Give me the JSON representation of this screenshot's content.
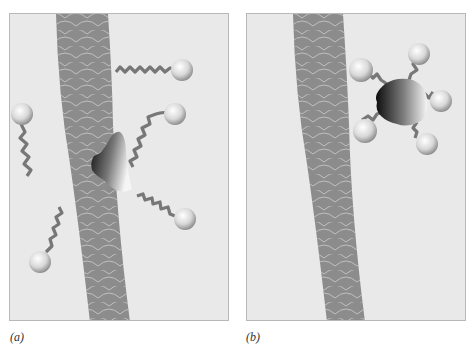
{
  "figure": {
    "panels": [
      {
        "id": "a",
        "label": "(a)",
        "description": "Hair fiber with oily dirt and free surfactant molecules approaching"
      },
      {
        "id": "b",
        "label": "(b)",
        "description": "Dirt lifted from hair fiber, surrounded by surfactant molecules (micelle)"
      }
    ]
  },
  "colors": {
    "background": "#e9e9e9",
    "fiber": "#8c8c8c",
    "fiber_scale_lines": "#cfcfcf",
    "tail": "#7a7a7a",
    "head_light": "#ffffff",
    "head_dark": "#9a9a9a",
    "dirt_dark": "#111111",
    "dirt_light": "#f4f4f4"
  }
}
